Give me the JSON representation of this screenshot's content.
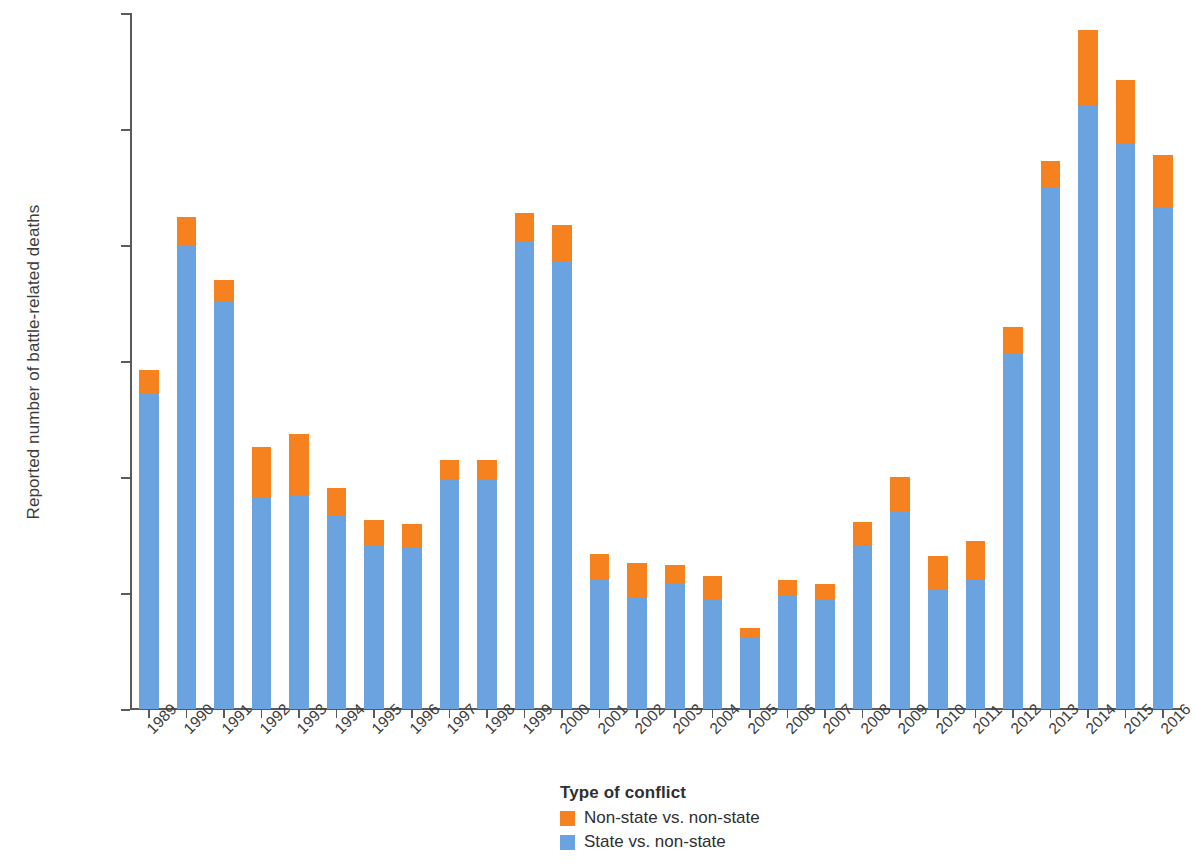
{
  "chart_data": {
    "type": "bar",
    "stacked": true,
    "title": "",
    "xlabel": "",
    "ylabel": "Reported number of battle-related deaths",
    "ylim": [
      0,
      120000
    ],
    "yticks": [
      0,
      20000,
      40000,
      60000,
      80000,
      100000,
      120000
    ],
    "ytick_labels": [
      "0",
      "20,000",
      "40,000",
      "60,000",
      "80,000",
      "100,000",
      "120,000"
    ],
    "grid": false,
    "legend_position": "bottom",
    "legend_title": "Type of conflict",
    "categories": [
      "1989",
      "1990",
      "1991",
      "1992",
      "1993",
      "1994",
      "1995",
      "1996",
      "1997",
      "1998",
      "1999",
      "2000",
      "2001",
      "2002",
      "2003",
      "2004",
      "2005",
      "2006",
      "2007",
      "2008",
      "2009",
      "2010",
      "2011",
      "2012",
      "2013",
      "2014",
      "2015",
      "2016"
    ],
    "series": [
      {
        "name": "State vs. non-state",
        "color": "#6aa3e0",
        "values": [
          54300,
          79800,
          70400,
          36300,
          36700,
          33200,
          28300,
          27900,
          39600,
          39500,
          80500,
          77100,
          22200,
          19100,
          21500,
          19000,
          12500,
          19400,
          18800,
          28300,
          34000,
          20700,
          22500,
          61300,
          89900,
          104100,
          97400,
          86500
        ]
      },
      {
        "name": "Non-state vs. non-state",
        "color": "#f5811f",
        "values": [
          4100,
          5000,
          3600,
          8900,
          10700,
          4900,
          4300,
          4000,
          3300,
          3400,
          5100,
          6300,
          4600,
          6100,
          3300,
          3900,
          1400,
          2900,
          2700,
          3900,
          6000,
          5600,
          6500,
          4500,
          4600,
          13000,
          11000,
          9100
        ]
      }
    ],
    "totals": [
      58400,
      84800,
      74000,
      45200,
      47400,
      38100,
      32600,
      31900,
      42900,
      42900,
      85600,
      83400,
      26800,
      25200,
      24800,
      22900,
      13900,
      22300,
      21500,
      32200,
      40000,
      26300,
      29000,
      65800,
      94500,
      117100,
      108400,
      95600
    ]
  },
  "legend": {
    "title": "Type of conflict",
    "entries": [
      {
        "label": "Non-state vs. non-state",
        "color": "#f5811f"
      },
      {
        "label": "State vs. non-state",
        "color": "#6aa3e0"
      }
    ]
  }
}
